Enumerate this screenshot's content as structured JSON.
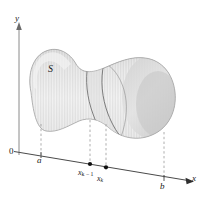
{
  "figure": {
    "kind": "calculus-solid-cross-section-diagram",
    "background_color": "#ffffff"
  },
  "axes": {
    "y_axis": {
      "label": "y",
      "color": "#8a8a8a",
      "arrow": "up"
    },
    "x_axis": {
      "label": "x",
      "color": "#4a4a4a",
      "arrow": "right"
    },
    "origin_label": "0"
  },
  "labels": {
    "solid": "S",
    "left_bound": "a",
    "right_bound": "b",
    "partition_left_base": "x",
    "partition_left_sub": "k − 1",
    "partition_right_base": "x",
    "partition_right_sub": "k"
  },
  "colors": {
    "solid_fill_light": "#e9e9e9",
    "solid_fill_mid": "#dcdcdc",
    "solid_fill_dark": "#c9c9c9",
    "solid_edge": "#9a9a9a",
    "slab_edge": "#6f6f6f",
    "dashed_line": "#9a9a9a",
    "axis_line": "#4a4a4a",
    "text": "#1a1a1a",
    "point_marker": "#111111"
  },
  "markers": {
    "points_on_axis": [
      "x_k_minus_1",
      "x_k"
    ],
    "tick_marks": [
      "a",
      "b"
    ]
  }
}
